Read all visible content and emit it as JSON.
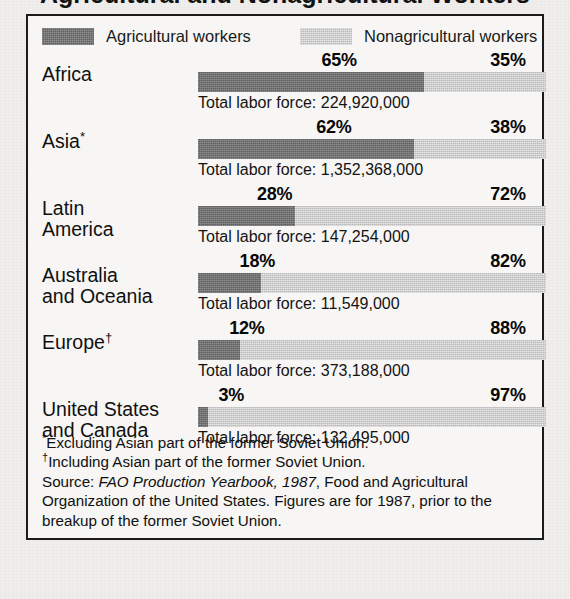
{
  "title_partial": "Agricultural and Nonagricultural Workers",
  "legend": {
    "agricultural": "Agricultural workers",
    "nonagricultural": "Nonagricultural workers",
    "agri_color": "#6e6e6e",
    "nonagri_color": "#cdcdcd"
  },
  "total_prefix": "Total labor force: ",
  "chart_data": {
    "type": "bar",
    "orientation": "horizontal",
    "stacked": true,
    "title": "Agricultural and Nonagricultural Workers",
    "xlabel": "",
    "ylabel": "",
    "xlim": [
      0,
      100
    ],
    "grid": false,
    "legend_position": "top",
    "categories": [
      "Africa",
      "Asia*",
      "Latin America",
      "Australia and Oceania",
      "Europe†",
      "United States and Canada"
    ],
    "series": [
      {
        "name": "Agricultural workers",
        "values": [
          65,
          62,
          28,
          18,
          12,
          3
        ]
      },
      {
        "name": "Nonagricultural workers",
        "values": [
          35,
          38,
          72,
          82,
          88,
          97
        ]
      }
    ],
    "annotations": {
      "total_labor_force": [
        "224,920,000",
        "1,352,368,000",
        "147,254,000",
        "11,549,000",
        "373,188,000",
        "132,495,000"
      ]
    }
  },
  "rows": [
    {
      "label": "Africa",
      "label_line1": "Africa",
      "label_line2": "",
      "marker": "",
      "agri_pct": 65,
      "nonagri_pct": 35,
      "agri_pct_text": "65%",
      "nonagri_pct_text": "35%",
      "total": "Total labor force: 224,920,000"
    },
    {
      "label": "Asia*",
      "label_line1": "Asia",
      "label_line2": "",
      "marker": "*",
      "agri_pct": 62,
      "nonagri_pct": 38,
      "agri_pct_text": "62%",
      "nonagri_pct_text": "38%",
      "total": "Total labor force: 1,352,368,000"
    },
    {
      "label": "Latin America",
      "label_line1": "Latin",
      "label_line2": "America",
      "marker": "",
      "agri_pct": 28,
      "nonagri_pct": 72,
      "agri_pct_text": "28%",
      "nonagri_pct_text": "72%",
      "total": "Total labor force: 147,254,000"
    },
    {
      "label": "Australia and Oceania",
      "label_line1": "Australia",
      "label_line2": "and Oceania",
      "marker": "",
      "agri_pct": 18,
      "nonagri_pct": 82,
      "agri_pct_text": "18%",
      "nonagri_pct_text": "82%",
      "total": "Total labor force: 11,549,000"
    },
    {
      "label": "Europe†",
      "label_line1": "Europe",
      "label_line2": "",
      "marker": "†",
      "agri_pct": 12,
      "nonagri_pct": 88,
      "agri_pct_text": "12%",
      "nonagri_pct_text": "88%",
      "total": "Total labor force: 373,188,000"
    },
    {
      "label": "United States and Canada",
      "label_line1": "United States",
      "label_line2": "and Canada",
      "marker": "",
      "agri_pct": 3,
      "nonagri_pct": 97,
      "agri_pct_text": "3%",
      "nonagri_pct_text": "97%",
      "total": "Total labor force: 132,495,000"
    }
  ],
  "notes": {
    "note1_marker": "*",
    "note1": "Excluding Asian part of the former Soviet Union.",
    "note2_marker": "†",
    "note2": "Including Asian part of the former Soviet Union.",
    "source_prefix": "Source: ",
    "source_italic": "FAO Production Yearbook, 1987",
    "source_rest": ", Food and Agricultural Organization of the United States. Figures are for 1987, prior to the breakup of the former Soviet Union."
  }
}
